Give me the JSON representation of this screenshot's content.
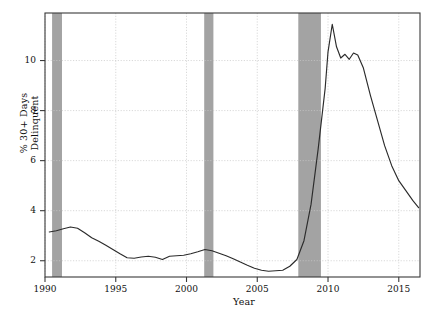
{
  "chart_data": {
    "type": "line",
    "title": "",
    "xlabel": "Year",
    "ylabel": "% 30+ Days Delinquent",
    "xlim": [
      1990,
      2016.5
    ],
    "ylim": [
      1.35,
      11.9
    ],
    "xticks": [
      1990,
      1995,
      2000,
      2005,
      2010,
      2015
    ],
    "xtick_labels": [
      "1990",
      "1995",
      "2000",
      "2005",
      "2010",
      "2015"
    ],
    "yticks": [
      2,
      4,
      6,
      8,
      10
    ],
    "ytick_labels": [
      "2",
      "4",
      "6",
      "8",
      "10"
    ],
    "grid": true,
    "legend": "none",
    "line_color": "#2b2b2b",
    "band_color": "#9e9e9e",
    "frame_color": "#3a3a3a",
    "grid_color": "#c8c8c8",
    "recession_bands": [
      {
        "start": 1990.5,
        "end": 1991.2
      },
      {
        "start": 2001.25,
        "end": 2001.9
      },
      {
        "start": 2007.9,
        "end": 2009.5
      }
    ],
    "series": [
      {
        "name": "% 30+ Days Delinquent",
        "x": [
          1990.3,
          1990.8,
          1991.3,
          1991.8,
          1992.3,
          1992.8,
          1993.3,
          1993.8,
          1994.3,
          1994.8,
          1995.3,
          1995.8,
          1996.3,
          1996.8,
          1997.3,
          1997.8,
          1998.3,
          1998.8,
          1999.3,
          1999.8,
          2000.3,
          2000.8,
          2001.3,
          2001.8,
          2002.3,
          2002.8,
          2003.3,
          2003.8,
          2004.3,
          2004.8,
          2005.3,
          2005.8,
          2006.3,
          2006.8,
          2007.3,
          2007.8,
          2008.3,
          2008.8,
          2009.3,
          2009.8,
          2010.0,
          2010.3,
          2010.6,
          2010.9,
          2011.2,
          2011.5,
          2011.8,
          2012.1,
          2012.5,
          2013.0,
          2013.5,
          2014.0,
          2014.5,
          2015.0,
          2015.5,
          2016.0,
          2016.4
        ],
        "y": [
          3.15,
          3.2,
          3.28,
          3.35,
          3.3,
          3.12,
          2.92,
          2.78,
          2.62,
          2.45,
          2.28,
          2.12,
          2.1,
          2.15,
          2.18,
          2.14,
          2.05,
          2.18,
          2.2,
          2.22,
          2.28,
          2.36,
          2.45,
          2.4,
          2.3,
          2.2,
          2.08,
          1.95,
          1.82,
          1.7,
          1.62,
          1.58,
          1.6,
          1.62,
          1.78,
          2.05,
          2.8,
          4.25,
          6.45,
          8.9,
          10.35,
          11.45,
          10.55,
          10.1,
          10.25,
          10.05,
          10.3,
          10.22,
          9.7,
          8.6,
          7.6,
          6.6,
          5.8,
          5.2,
          4.8,
          4.4,
          4.12
        ]
      }
    ]
  },
  "figure": {
    "plot_left": 45,
    "plot_right": 420,
    "plot_top": 13,
    "plot_bottom": 277
  }
}
